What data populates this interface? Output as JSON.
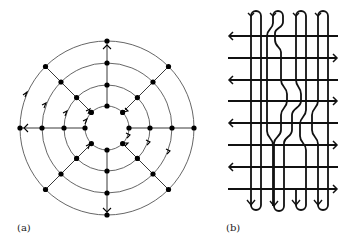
{
  "panels": [
    {
      "label": "(a)",
      "kind": "concentric-circle-graph",
      "rings": 4,
      "spokes": 8
    },
    {
      "label": "(b)",
      "kind": "braid-grid",
      "horizontal_lines": 8,
      "vertical_loops": 4
    }
  ],
  "colors": {
    "line": "#111111",
    "circle": "#555555",
    "background": "#ffffff"
  }
}
